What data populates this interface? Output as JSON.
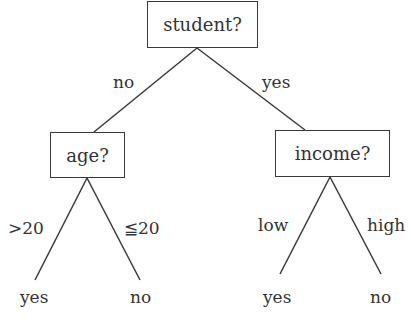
{
  "tree": {
    "root": {
      "label": "student?"
    },
    "edges": {
      "root_left": "no",
      "root_right": "yes",
      "age_left": ">20",
      "age_right": "≦20",
      "income_left": "low",
      "income_right": "high"
    },
    "nodes": {
      "age": {
        "label": "age?"
      },
      "income": {
        "label": "income?"
      }
    },
    "leaves": {
      "age_gt20": "yes",
      "age_le20": "no",
      "income_low": "yes",
      "income_high": "no"
    },
    "colors": {
      "line": "#3a3a3a",
      "text": "#333333"
    }
  }
}
